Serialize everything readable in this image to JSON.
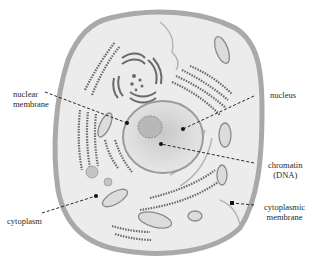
{
  "diagram": {
    "labels": {
      "nuclear_membrane": {
        "line1": "nuclear",
        "line2": "membrane"
      },
      "nucleus": {
        "line1": "nucleus"
      },
      "chromatin": {
        "line1": "chromatin",
        "line2": "(DNA)"
      },
      "cytoplasm": {
        "line1": "cytoplasm"
      },
      "cytoplasmic_membrane": {
        "line1": "cytoplasmic",
        "line2": "membrane"
      }
    },
    "colors": {
      "membrane": "#a9a9a9",
      "cytoplasm": "#ececec",
      "nucleus": "#d6d6d6",
      "organelle": "#7a7a7a",
      "leader_line": "#2a2a2a"
    }
  }
}
